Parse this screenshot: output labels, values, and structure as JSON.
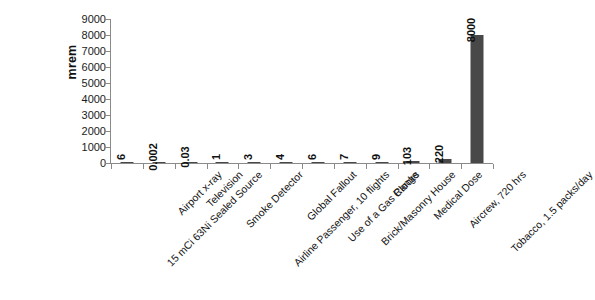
{
  "chart_data": {
    "type": "bar",
    "title": "",
    "xlabel": "",
    "ylabel": "mrem",
    "ylim": [
      0,
      9000
    ],
    "grid": false,
    "legend": false,
    "orientation": "vertical",
    "bar_color": "#484848",
    "axis_color": "#8a8a8a",
    "background": "#ffffff",
    "value_labels_rotated": true,
    "category_labels_rotated": true,
    "category_label_angle_deg": -45,
    "value_label_angle_deg": -90,
    "yticks": [
      0,
      1000,
      2000,
      3000,
      4000,
      5000,
      6000,
      7000,
      8000,
      9000
    ],
    "ytick_labels": [
      "0",
      "1000",
      "2000",
      "3000",
      "4000",
      "5000",
      "6000",
      "7000",
      "8000",
      "9000"
    ],
    "categories": [
      "15 mCi 63Ni Sealed Source",
      "Airport x-ray",
      "Television",
      "Smoke Detector",
      "Airline Passenger, 10 flights",
      "Global Fallout",
      "Use of a Gas Range",
      "Brick/Masonry House",
      "Clocks",
      "Medical Dose",
      "Aircrew, 720 hrs",
      "Tobacco, 1.5 packs/day"
    ],
    "values": [
      6,
      0.002,
      0.03,
      1,
      3,
      4,
      6,
      7,
      9,
      103,
      220,
      8000
    ],
    "value_labels": [
      "6",
      "0.002",
      "0.03",
      "1",
      "3",
      "4",
      "6",
      "7",
      "9",
      "103",
      "220",
      "8000"
    ]
  }
}
